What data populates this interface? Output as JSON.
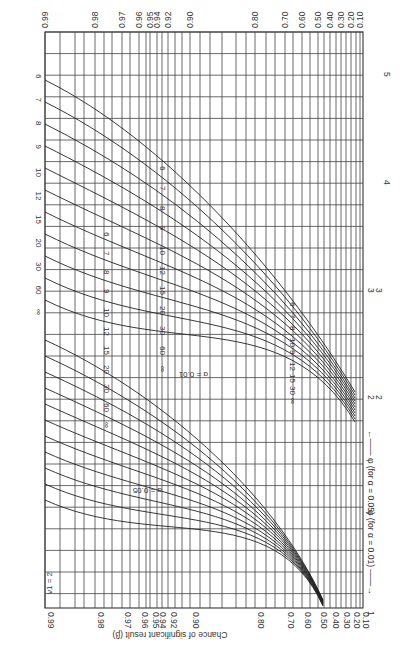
{
  "chart_data": {
    "type": "line",
    "orientation": "rotated 90deg clockwise (power axis horizontal, phi axis vertical)",
    "ylabel": "Chance of significant result (β)",
    "xlabel_alpha_05": "φ (for α = 0.05)",
    "xlabel_alpha_01": "φ (for α = 0.01)",
    "nu1_label": "ν1 = 2",
    "nu2_label": "ν2 = ∞",
    "power_ticks": [
      0.1,
      0.2,
      0.3,
      0.4,
      0.5,
      0.6,
      0.7,
      0.8,
      0.9,
      0.92,
      0.94,
      0.95,
      0.96,
      0.97,
      0.98,
      0.99
    ],
    "phi_ticks_alpha_05": [
      2,
      3,
      4,
      5
    ],
    "phi_ticks_alpha_01": [
      1,
      2,
      3
    ],
    "series_labels_nu2": [
      "6",
      "7",
      "8",
      "9",
      "10",
      "12",
      "15",
      "20",
      "30",
      "60",
      "∞"
    ],
    "groups": [
      {
        "name": "α = 0.05",
        "phi_range": [
          1.8,
          5.5
        ],
        "nu2": [
          "6",
          "7",
          "8",
          "9",
          "10",
          "12",
          "15",
          "20",
          "30",
          "60",
          "∞"
        ]
      },
      {
        "name": "α = 0.01",
        "phi_range": [
          1.0,
          3.8
        ],
        "nu2": [
          "6",
          "7",
          "8",
          "9",
          "10",
          "12",
          "15",
          "20",
          "30",
          "60",
          "∞"
        ]
      }
    ],
    "annotations": [
      "α = 0.05",
      "α = 0.01",
      "6",
      "8",
      "10",
      "15",
      "30",
      "∞"
    ],
    "grid": true
  },
  "labels": {
    "top_ticks": [
      "0.99",
      "0.98",
      "0.97",
      "0.96",
      "0.95",
      "0.94",
      "0.92",
      "0.90",
      "0.80",
      "0.70",
      "0.60",
      "0.50",
      "0.40",
      "0.30",
      "0.20",
      "0.10"
    ],
    "bottom_ticks": [
      "0.99",
      "0.98",
      "0.97",
      "0.96",
      "0.95",
      "0.94",
      "0.92",
      "0.90",
      "0.80",
      "0.70",
      "0.60",
      "0.50",
      "0.40",
      "0.30",
      "0.20",
      "0.10"
    ],
    "right_phi05": [
      "5",
      "4",
      "3",
      "2"
    ],
    "right_phi01": [
      "3",
      "2",
      "1"
    ],
    "axis_title": "Chance of significant result (β)",
    "phi05_title": "φ (for α = 0.05)",
    "phi01_title": "φ (for α = 0.01)",
    "nu1": "ν1 = 2",
    "nu1_one": "1",
    "nu2": "ν2 = ∞",
    "alpha05": "α = 0.05",
    "alpha01": "α = 0.01",
    "top_row": [
      "6",
      "7",
      "8",
      "9",
      "10",
      "12",
      "15",
      "20",
      "30",
      "60",
      "∞"
    ],
    "mid_row": [
      "6",
      "7",
      "8",
      "9",
      "10",
      "12",
      "15",
      "20",
      "30",
      "60",
      "∞"
    ],
    "lower_row": [
      "6",
      "7",
      "8",
      "9",
      "10",
      "12",
      "15",
      "20",
      "30",
      "60",
      "∞"
    ],
    "low_row": [
      "6",
      "7",
      "8",
      "10",
      "9",
      "12",
      "15",
      "30",
      "∞"
    ],
    "callouts_upper": [
      "6",
      "8",
      "10"
    ],
    "callouts_lower": [
      "∞",
      "30",
      "15"
    ]
  }
}
